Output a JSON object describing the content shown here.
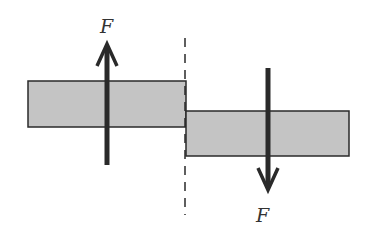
{
  "diagram": {
    "labels": {
      "force_up": "F",
      "force_down": "F"
    },
    "colors": {
      "plate_fill": "#c4c4c4",
      "outline": "#2a2a2a",
      "arrow": "#2a2a2a"
    }
  }
}
